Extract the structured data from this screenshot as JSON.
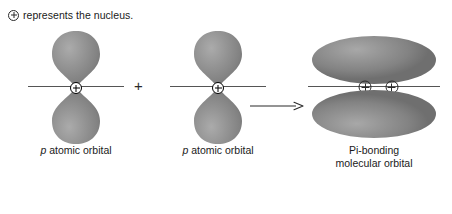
{
  "figure": {
    "caption": {
      "nucleus_symbol": "nucleus-plus-circle-icon",
      "text": "represents the nucleus."
    },
    "operators": {
      "plus": "+",
      "arrow": "arrow-right-icon"
    },
    "panels": [
      {
        "id": "p-orbital-1",
        "label_prefix": "p",
        "label_rest": " atomic orbital",
        "lobes": 2,
        "nuclei": 1
      },
      {
        "id": "p-orbital-2",
        "label_prefix": "p",
        "label_rest": " atomic orbital",
        "lobes": 2,
        "nuclei": 1
      },
      {
        "id": "pi-molecular-orbital",
        "label_line1": "Pi-bonding",
        "label_line2": "molecular orbital",
        "lobes": 2,
        "nuclei": 2
      }
    ],
    "colors": {
      "lobe_light": "#a8a8a8",
      "lobe_mid": "#8d8d8d",
      "lobe_dark": "#6f6f6f",
      "axis": "#555555",
      "ink": "#1a1a1a",
      "background": "#ffffff"
    }
  }
}
